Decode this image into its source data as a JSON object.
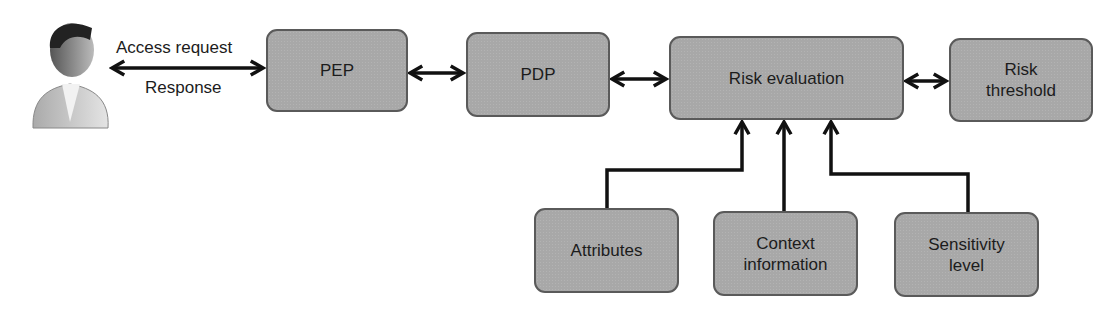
{
  "actor": {
    "icon": "user-icon"
  },
  "edges_labels": {
    "request": "Access request",
    "response": "Response"
  },
  "nodes": {
    "pep": {
      "label": "PEP"
    },
    "pdp": {
      "label": "PDP"
    },
    "risk_eval": {
      "label": "Risk evaluation"
    },
    "risk_threshold": {
      "line1": "Risk",
      "line2": "threshold"
    },
    "attributes": {
      "label": "Attributes"
    },
    "context": {
      "line1": "Context",
      "line2": "information"
    },
    "sensitivity": {
      "line1": "Sensitivity",
      "line2": "level"
    }
  },
  "colors": {
    "box_fill": "#a8a8a8",
    "box_border": "#5a5a5a",
    "arrow": "#111111"
  }
}
